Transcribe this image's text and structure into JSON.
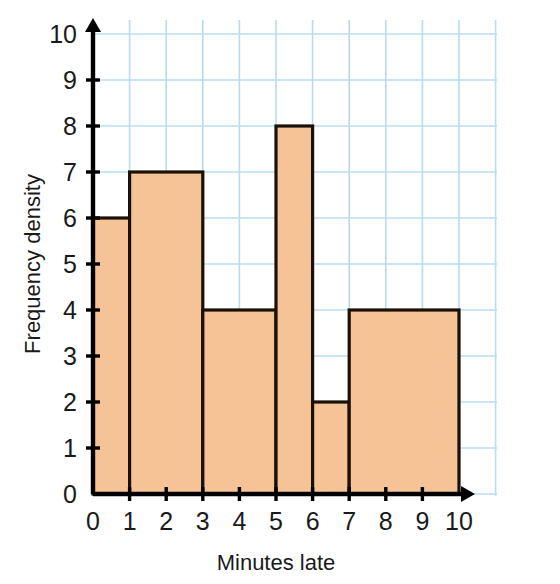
{
  "chart_data": {
    "type": "bar",
    "title": "",
    "subtitle": "",
    "xlabel": "Minutes late",
    "ylabel": "Frequency density",
    "xlim": [
      0,
      10
    ],
    "ylim": [
      0,
      10
    ],
    "grid": true,
    "legend": "none",
    "xticks": [
      "0",
      "1",
      "2",
      "3",
      "4",
      "5",
      "6",
      "7",
      "8",
      "9",
      "10"
    ],
    "yticks": [
      "0",
      "1",
      "2",
      "3",
      "4",
      "5",
      "6",
      "7",
      "8",
      "9",
      "10"
    ],
    "bars": [
      {
        "x0": 0,
        "x1": 1,
        "height": 6
      },
      {
        "x0": 1,
        "x1": 3,
        "height": 7
      },
      {
        "x0": 3,
        "x1": 5,
        "height": 4
      },
      {
        "x0": 5,
        "x1": 6,
        "height": 8
      },
      {
        "x0": 6,
        "x1": 7,
        "height": 2
      },
      {
        "x0": 7,
        "x1": 10,
        "height": 4
      }
    ],
    "colors": {
      "bar_fill": "#f5c396",
      "bar_stroke": "#1a1008",
      "grid": "#b8dcef",
      "axis": "#000000",
      "text": "#1a1a1a",
      "background": "#ffffff"
    }
  }
}
